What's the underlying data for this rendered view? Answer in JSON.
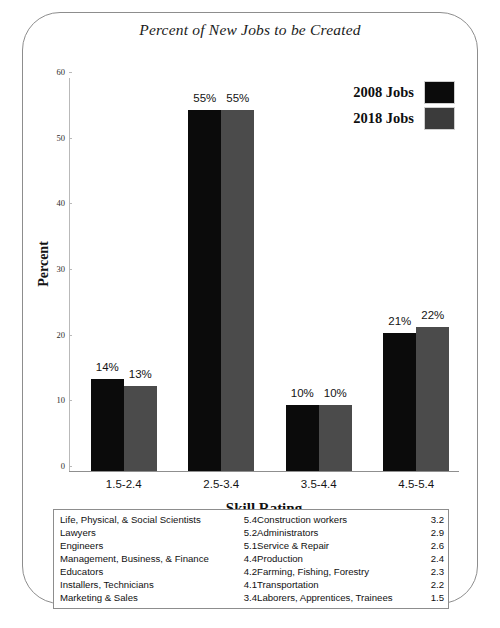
{
  "chart_data": {
    "type": "bar",
    "title": "Percent of New Jobs to be Created",
    "xlabel": "Skill Rating",
    "ylabel": "Percent",
    "categories": [
      "1.5-2.4",
      "2.5-3.4",
      "3.5-4.4",
      "4.5-5.4"
    ],
    "series": [
      {
        "name": "2008 Jobs",
        "color": "#0b0b0b",
        "values": [
          14,
          55,
          10,
          21
        ],
        "labels": [
          "14%",
          "55%",
          "10%",
          "21%"
        ]
      },
      {
        "name": "2018 Jobs",
        "color": "#4b4b4b",
        "values": [
          13,
          55,
          10,
          22
        ],
        "labels": [
          "13%",
          "55%",
          "10%",
          "22%"
        ]
      }
    ],
    "ylim": [
      0,
      60
    ],
    "yticks": [
      0,
      10,
      20,
      30,
      40,
      50,
      60
    ],
    "ytick_labels": [
      "0",
      "10",
      "20",
      "30",
      "40",
      "50",
      "60"
    ],
    "grid": false,
    "legend_position": "top-right"
  },
  "legend": {
    "items": [
      {
        "label": "2008 Jobs"
      },
      {
        "label": "2018 Jobs"
      }
    ]
  },
  "occupations": {
    "rows": [
      {
        "left_name": "Life, Physical, & Social Scientists",
        "left_value": "5.4",
        "right_name": "Construction workers",
        "right_value": "3.2"
      },
      {
        "left_name": "Lawyers",
        "left_value": "5.2",
        "right_name": "Administrators",
        "right_value": "2.9"
      },
      {
        "left_name": "Engineers",
        "left_value": "5.1",
        "right_name": "Service & Repair",
        "right_value": "2.6"
      },
      {
        "left_name": "Management, Business, & Finance",
        "left_value": "4.4",
        "right_name": "Production",
        "right_value": "2.4"
      },
      {
        "left_name": "Educators",
        "left_value": "4.2",
        "right_name": "Farming, Fishing, Forestry",
        "right_value": "2.3"
      },
      {
        "left_name": "Installers, Technicians",
        "left_value": "4.1",
        "right_name": "Transportation",
        "right_value": "2.2"
      },
      {
        "left_name": "Marketing & Sales",
        "left_value": "3.4",
        "right_name": "Laborers, Apprentices, Trainees",
        "right_value": "1.5"
      }
    ]
  }
}
